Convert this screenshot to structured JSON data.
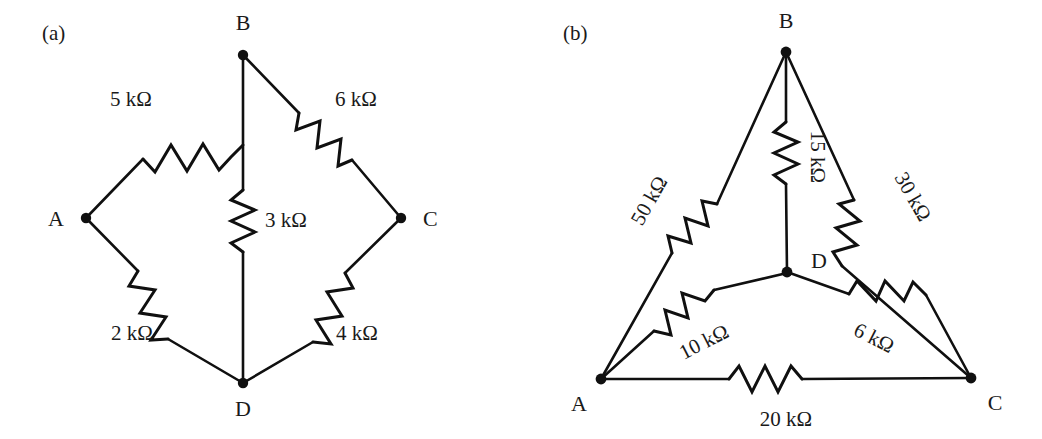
{
  "figure": {
    "background_color": "#ffffff",
    "ink_color": "#101010",
    "width": 1042,
    "height": 439
  },
  "panels": [
    {
      "id": "a",
      "tag": "(a)",
      "tag_pos": {
        "x": 42,
        "y": 40
      },
      "topology": "bridge",
      "nodes": [
        {
          "id": "A",
          "label": "A",
          "x": 86,
          "y": 218,
          "label_x": 64,
          "label_y": 226
        },
        {
          "id": "B",
          "label": "B",
          "x": 243,
          "y": 55,
          "label_x": 243,
          "label_y": 28
        },
        {
          "id": "C",
          "label": "C",
          "x": 401,
          "y": 218,
          "label_x": 423,
          "label_y": 226
        },
        {
          "id": "D",
          "label": "D",
          "x": 243,
          "y": 383,
          "label_x": 243,
          "label_y": 414
        }
      ],
      "resistors": [
        {
          "id": "a-AB",
          "between": "A-B",
          "value": "5 kΩ",
          "label_x": 131,
          "label_y": 106,
          "label_anchor": "middle",
          "label_rotation": 0
        },
        {
          "id": "a-BC",
          "between": "B-C",
          "value": "6 kΩ",
          "label_x": 356,
          "label_y": 106,
          "label_anchor": "middle",
          "label_rotation": 0
        },
        {
          "id": "a-BD",
          "between": "B-D",
          "value": "3 kΩ",
          "label_x": 265,
          "label_y": 227,
          "label_anchor": "start",
          "label_rotation": 0
        },
        {
          "id": "a-AD",
          "between": "A-D",
          "value": "2 kΩ",
          "label_x": 132,
          "label_y": 340,
          "label_anchor": "middle",
          "label_rotation": 0
        },
        {
          "id": "a-DC",
          "between": "D-C",
          "value": "4 kΩ",
          "label_x": 357,
          "label_y": 340,
          "label_anchor": "middle",
          "label_rotation": 0
        }
      ]
    },
    {
      "id": "b",
      "tag": "(b)",
      "tag_pos": {
        "x": 42,
        "y": 40
      },
      "topology": "delta-with-star",
      "nodes": [
        {
          "id": "A",
          "label": "A",
          "x": 80,
          "y": 379,
          "label_x": 58,
          "label_y": 409
        },
        {
          "id": "B",
          "label": "B",
          "x": 265,
          "y": 52,
          "label_x": 265,
          "label_y": 27
        },
        {
          "id": "C",
          "label": "C",
          "x": 450,
          "y": 378,
          "label_x": 474,
          "label_y": 408
        },
        {
          "id": "D",
          "label": "D",
          "x": 266,
          "y": 272,
          "label_x": 288,
          "label_y": 268
        }
      ],
      "resistors": [
        {
          "id": "b-AB",
          "between": "A-B",
          "value": "50 kΩ",
          "label_x": 134,
          "label_y": 204,
          "label_anchor": "middle",
          "label_rotation": -60
        },
        {
          "id": "b-BC",
          "between": "B-C",
          "value": "30 kΩ",
          "label_x": 386,
          "label_y": 200,
          "label_anchor": "middle",
          "label_rotation": 60
        },
        {
          "id": "b-BD",
          "between": "B-D",
          "value": "15 kΩ",
          "label_x": 288,
          "label_y": 160,
          "label_anchor": "middle",
          "label_rotation": 90
        },
        {
          "id": "b-AD",
          "between": "A-D",
          "value": "10 kΩ",
          "label_x": 186,
          "label_y": 348,
          "label_anchor": "middle",
          "label_rotation": -27
        },
        {
          "id": "b-DC",
          "between": "D-C",
          "value": "6 kΩ",
          "label_x": 350,
          "label_y": 344,
          "label_anchor": "middle",
          "label_rotation": 27
        },
        {
          "id": "b-AC",
          "between": "A-C",
          "value": "20 kΩ",
          "label_x": 265,
          "label_y": 425,
          "label_anchor": "middle",
          "label_rotation": 0
        }
      ]
    }
  ]
}
